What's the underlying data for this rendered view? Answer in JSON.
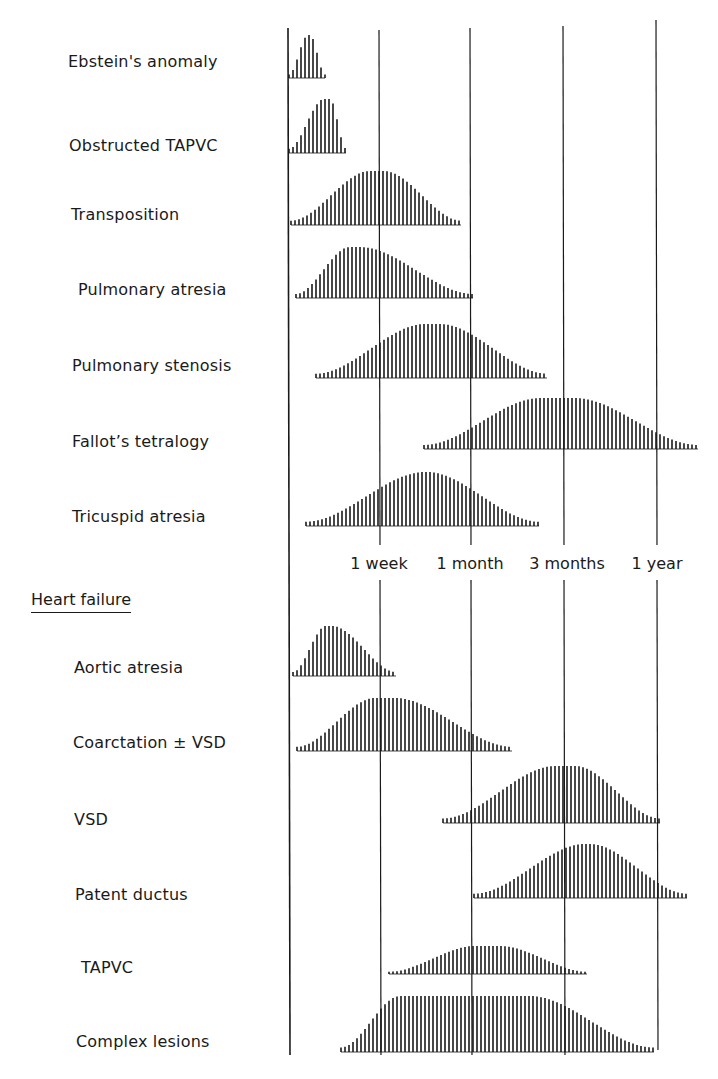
{
  "chart_data": {
    "type": "area",
    "title": "",
    "xlabel": "Age at presentation",
    "ylabel": "",
    "x_ticks": [
      "1 week",
      "1 month",
      "3 months",
      "1 year"
    ],
    "x_scale": "log-like age (birth at left axis)",
    "grid": "vertical lines at each tick",
    "style": "vertical hatched distribution curves",
    "groups": [
      {
        "name": "",
        "series": [
          {
            "name": "Ebstein's anomaly",
            "start": "birth",
            "peak": "~2 days",
            "end": "~4 days"
          },
          {
            "name": "Obstructed TAPVC",
            "start": "birth",
            "peak": "~4 days",
            "end": "~6 days"
          },
          {
            "name": "Transposition",
            "start": "birth",
            "peak": "~1 week",
            "end": "~3 weeks"
          },
          {
            "name": "Pulmonary atresia",
            "start": "birth",
            "peak": "~5 days",
            "end": "~1 month"
          },
          {
            "name": "Pulmonary stenosis",
            "start": "~3 days",
            "peak": "~2.5 weeks",
            "end": "~2 months"
          },
          {
            "name": "Fallot's tetralogy",
            "start": "~2.5 weeks",
            "peak": "~3 months",
            "end": ">1 year"
          },
          {
            "name": "Tricuspid atresia",
            "start": "~2 days",
            "peak": "~2.5 weeks",
            "end": "~2 months"
          }
        ]
      },
      {
        "name": "Heart failure",
        "series": [
          {
            "name": "Aortic atresia",
            "start": "birth",
            "peak": "~3 days",
            "end": "~1 week"
          },
          {
            "name": "Coarctation ± VSD",
            "start": "birth",
            "peak": "~1 week",
            "end": "~6 weeks"
          },
          {
            "name": "VSD",
            "start": "~3 weeks",
            "peak": "~3 months",
            "end": "~1 year"
          },
          {
            "name": "Patent ductus",
            "start": "~1 month",
            "peak": "~4 months",
            "end": ">1 year"
          },
          {
            "name": "TAPVC",
            "start": "~1 week",
            "peak": "~1 month",
            "end": "~3 months"
          },
          {
            "name": "Complex lesions",
            "start": "~3 days",
            "peak": "~2 weeks to ~2 months",
            "end": "~1 year"
          }
        ]
      }
    ]
  },
  "plot": {
    "axis_x": 288,
    "axis_top": 28,
    "axis_bottom": 1055,
    "gridlines": [
      {
        "x": 379,
        "top": 30,
        "bottom": 1055
      },
      {
        "x": 470,
        "top": 28,
        "bottom": 1055
      },
      {
        "x": 563,
        "top": 26,
        "bottom": 1055
      },
      {
        "x": 656,
        "top": 20,
        "bottom": 1050
      }
    ],
    "label_gap": {
      "top": 545,
      "bottom": 580
    },
    "hatch_spacing": 4,
    "ink": "#1a1a1a",
    "curves": [
      {
        "start": 289,
        "peak": 308,
        "peak_end": 310,
        "end": 325,
        "base": 78,
        "top": 35
      },
      {
        "start": 289,
        "peak": 324,
        "peak_end": 330,
        "end": 346,
        "base": 153,
        "top": 99
      },
      {
        "start": 291,
        "peak": 370,
        "peak_end": 384,
        "end": 461,
        "base": 225,
        "top": 171
      },
      {
        "start": 296,
        "peak": 350,
        "peak_end": 360,
        "end": 473,
        "base": 298,
        "top": 247
      },
      {
        "start": 316,
        "peak": 425,
        "peak_end": 440,
        "end": 547,
        "base": 378,
        "top": 324
      },
      {
        "start": 424,
        "peak": 540,
        "peak_end": 575,
        "end": 698,
        "base": 449,
        "top": 398
      },
      {
        "start": 306,
        "peak": 425,
        "peak_end": 427,
        "end": 539,
        "base": 526,
        "top": 472
      },
      {
        "start": 293,
        "peak": 326,
        "peak_end": 332,
        "end": 396,
        "base": 676,
        "top": 626
      },
      {
        "start": 297,
        "peak": 375,
        "peak_end": 395,
        "end": 512,
        "base": 751,
        "top": 698
      },
      {
        "start": 443,
        "peak": 555,
        "peak_end": 575,
        "end": 660,
        "base": 823,
        "top": 766
      },
      {
        "start": 474,
        "peak": 585,
        "peak_end": 590,
        "end": 687,
        "base": 898,
        "top": 844
      },
      {
        "start": 389,
        "peak": 475,
        "peak_end": 500,
        "end": 587,
        "base": 974,
        "top": 946
      },
      {
        "start": 341,
        "peak": 400,
        "peak_end": 530,
        "end": 654,
        "base": 1052,
        "top": 996
      }
    ]
  },
  "labels": {
    "group1": [
      {
        "text": "Ebstein's anomaly",
        "x": 68,
        "y": 52
      },
      {
        "text": "Obstructed TAPVC",
        "x": 69,
        "y": 136
      },
      {
        "text": "Transposition",
        "x": 71,
        "y": 205
      },
      {
        "text": "Pulmonary atresia",
        "x": 78,
        "y": 280
      },
      {
        "text": "Pulmonary stenosis",
        "x": 72,
        "y": 356
      },
      {
        "text": "Fallot’s tetralogy",
        "x": 72,
        "y": 432
      },
      {
        "text": "Tricuspid atresia",
        "x": 72,
        "y": 507
      }
    ],
    "section_title": {
      "text": "Heart failure",
      "x": 31,
      "y": 590
    },
    "group2": [
      {
        "text": "Aortic atresia",
        "x": 74,
        "y": 658
      },
      {
        "text": "Coarctation  ±  VSD",
        "x": 73,
        "y": 733
      },
      {
        "text": "VSD",
        "x": 74,
        "y": 810
      },
      {
        "text": "Patent ductus",
        "x": 75,
        "y": 885
      },
      {
        "text": "TAPVC",
        "x": 81,
        "y": 958
      },
      {
        "text": "Complex lesions",
        "x": 76,
        "y": 1032
      }
    ],
    "ticks": [
      {
        "text": "1 week",
        "x": 379,
        "y": 554
      },
      {
        "text": "1 month",
        "x": 470,
        "y": 554
      },
      {
        "text": "3 months",
        "x": 567,
        "y": 554
      },
      {
        "text": "1 year",
        "x": 657,
        "y": 554
      }
    ]
  }
}
